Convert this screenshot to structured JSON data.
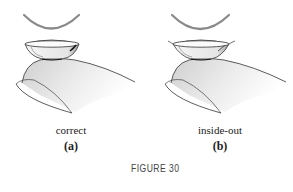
{
  "figure": {
    "caption": "FIGURE 30",
    "panels": [
      {
        "id": "a",
        "label": "correct",
        "sublabel": "(a)",
        "illustration": "contact-lens-on-fingertip-correct"
      },
      {
        "id": "b",
        "label": "inside-out",
        "sublabel": "(b)",
        "illustration": "contact-lens-on-fingertip-inside-out"
      }
    ]
  },
  "colors": {
    "background": "#ffffff",
    "arc": "#8a8a8a",
    "line": "#333333",
    "finger_shade": "#d9d9d9",
    "caption": "#444444"
  }
}
